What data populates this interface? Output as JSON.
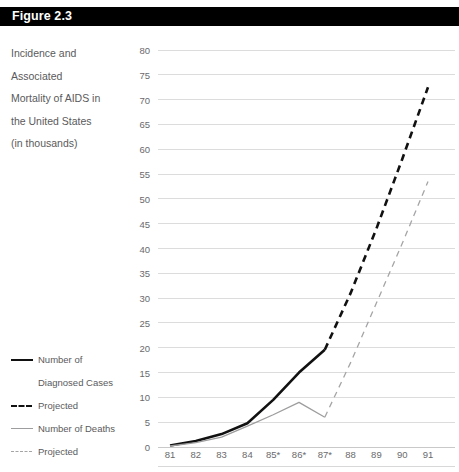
{
  "figure": {
    "label": "Figure 2.3"
  },
  "caption": {
    "lines": [
      "Incidence and",
      "Associated",
      "Mortality of AIDS in",
      "the United States",
      "(in thousands)"
    ]
  },
  "legend": {
    "position": "left-bottom",
    "items": [
      {
        "label": "Number of",
        "sublabel": "Diagnosed Cases",
        "style": "solid-black",
        "swatch": "legend-line-solid-black-icon"
      },
      {
        "label": "Projected",
        "sublabel": "",
        "style": "dash-black",
        "swatch": "legend-line-dashed-black-icon"
      },
      {
        "label": "Number of Deaths",
        "sublabel": "",
        "style": "solid-gray",
        "swatch": "legend-line-solid-gray-icon"
      },
      {
        "label": "Projected",
        "sublabel": "",
        "style": "dash-gray",
        "swatch": "legend-line-dashed-gray-icon"
      }
    ]
  },
  "colors": {
    "bar_background": "#000000",
    "bar_text": "#ffffff",
    "cases_line": "#111111",
    "deaths_line": "#9d9d9f",
    "gridline": "#dcdcdc",
    "text": "#5a5a5c"
  },
  "chart_data": {
    "type": "line",
    "title": "Incidence and Associated Mortality of AIDS in the United States (in thousands)",
    "xlabel": "",
    "ylabel": "",
    "ylim": [
      0,
      80
    ],
    "ytick_step": 5,
    "yticks": [
      0,
      5,
      10,
      15,
      20,
      25,
      30,
      35,
      40,
      45,
      50,
      55,
      60,
      65,
      70,
      75,
      80
    ],
    "categories": [
      "81",
      "82",
      "83",
      "84",
      "85*",
      "86*",
      "87*",
      "88",
      "89",
      "90",
      "91"
    ],
    "grid": true,
    "legend_position": "left",
    "series": [
      {
        "name": "Number of Diagnosed Cases",
        "style": "solid",
        "color": "#111111",
        "x": [
          "81",
          "82",
          "83",
          "84",
          "85*",
          "86*",
          "87*"
        ],
        "values": [
          0.3,
          1.2,
          2.6,
          4.8,
          9.5,
          15.0,
          19.6
        ]
      },
      {
        "name": "Projected",
        "style": "dashed",
        "color": "#111111",
        "x": [
          "87*",
          "88",
          "89",
          "90",
          "91"
        ],
        "values": [
          19.6,
          31.0,
          44.0,
          58.0,
          72.5
        ]
      },
      {
        "name": "Number of Deaths",
        "style": "solid",
        "color": "#9d9d9f",
        "x": [
          "81",
          "82",
          "83",
          "84",
          "85*",
          "86*",
          "87*"
        ],
        "values": [
          0.2,
          0.9,
          2.0,
          4.2,
          6.5,
          9.0,
          6.0
        ]
      },
      {
        "name": "Projected",
        "style": "dashed",
        "color": "#a5a5a7",
        "x": [
          "87*",
          "88",
          "89",
          "90",
          "91"
        ],
        "values": [
          6.0,
          17.0,
          29.0,
          41.0,
          53.5
        ]
      }
    ]
  }
}
